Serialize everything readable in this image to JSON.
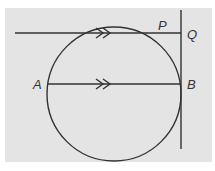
{
  "diagram": {
    "type": "geometry",
    "colors": {
      "background": "#e4e4e4",
      "stroke": "#333333"
    },
    "circle": {
      "cx": 114,
      "cy": 94,
      "r": 67
    },
    "lines": [
      {
        "id": "line-through-P",
        "x1": 15,
        "y1": 33,
        "x2": 181,
        "y2": 33,
        "marker": "double-arrow"
      },
      {
        "id": "diameter-AB",
        "x1": 47,
        "y1": 84,
        "x2": 181,
        "y2": 84,
        "marker": "double-arrow"
      },
      {
        "id": "tangent-at-B",
        "x1": 181,
        "y1": 10,
        "x2": 181,
        "y2": 149
      }
    ],
    "labels": {
      "P": "P",
      "Q": "Q",
      "A": "A",
      "B": "B"
    },
    "annotations": {
      "parallel_marker": "double arrowheads indicate PQ ∥ AB"
    }
  }
}
